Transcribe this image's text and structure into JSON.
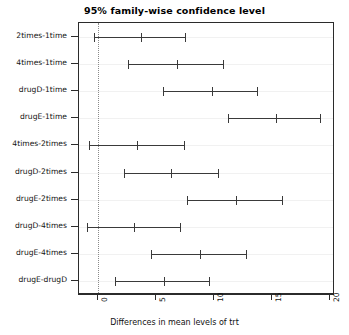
{
  "chart_data": {
    "type": "scatter",
    "title": "95% family-wise confidence level",
    "xlabel": "Differences in mean levels of trt",
    "ylabel": "",
    "xlim": [
      -1.6,
      20.4
    ],
    "xticks": [
      0,
      5,
      10,
      15,
      20
    ],
    "xtick_labels": [
      "0",
      "5",
      "10",
      "15",
      "20"
    ],
    "grid": "horizontal",
    "reference_line": 0,
    "reference_line_style": "dotted",
    "legend": "none",
    "categories": [
      "2times-1time",
      "4times-1time",
      "drugD-1time",
      "drugE-1time",
      "4times-2times",
      "drugD-2times",
      "drugE-2times",
      "drugD-4times",
      "drugE-4times",
      "drugE-drugD"
    ],
    "series": [
      {
        "name": "diff",
        "values": [
          3.7,
          6.8,
          9.8,
          15.3,
          3.4,
          6.3,
          11.9,
          3.1,
          8.8,
          5.7
        ]
      },
      {
        "name": "lwr",
        "values": [
          -0.3,
          2.6,
          5.6,
          11.2,
          -0.7,
          2.3,
          7.7,
          -0.9,
          4.6,
          1.5
        ]
      },
      {
        "name": "upr",
        "values": [
          7.6,
          10.9,
          13.8,
          19.2,
          7.5,
          10.4,
          15.9,
          7.2,
          12.8,
          9.7
        ]
      }
    ],
    "colors": {
      "interval": "#3a3a3a",
      "axis": "#2b2b2b",
      "grid": "#f1f1f1",
      "reference_line": "#8a8a8a",
      "background": "#ffffff"
    }
  }
}
